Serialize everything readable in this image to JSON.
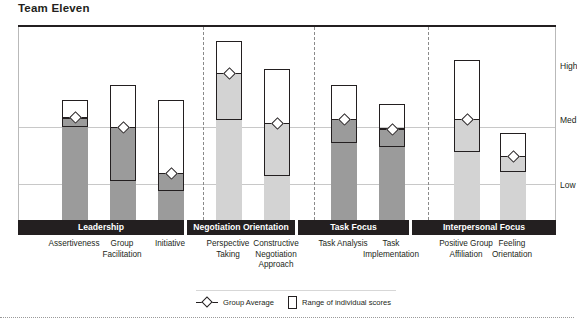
{
  "title": "Team Eleven",
  "axis": {
    "labels": [
      "High",
      "Med",
      "Low"
    ],
    "label_high": "High",
    "label_med": "Med",
    "label_low": "Low"
  },
  "legend": {
    "group_average": "Group Average",
    "range_of_individual_scores": "Range of individual scores"
  },
  "clusters": [
    {
      "name": "Leadership"
    },
    {
      "name": "Negotiation Orientation"
    },
    {
      "name": "Task Focus"
    },
    {
      "name": "Interpersonal Focus"
    }
  ],
  "categories": [
    "Assertiveness",
    "Group Facilitation",
    "Initiative",
    "Perspective Taking",
    "Constructive Negotiation Approach",
    "Task Analysis",
    "Task Implementation",
    "Positive Group Affiliation",
    "Feeling Orientation"
  ],
  "chart_data": {
    "type": "bar",
    "title": "Team Eleven",
    "xlabel": "",
    "ylabel": "",
    "ylim": [
      0,
      100
    ],
    "grid": true,
    "legend_position": "bottom",
    "axis_ticks": [
      {
        "label": "Low",
        "value": 18
      },
      {
        "label": "Med",
        "value": 52
      },
      {
        "label": "High",
        "value": 80
      }
    ],
    "categories": [
      "Assertiveness",
      "Group Facilitation",
      "Initiative",
      "Perspective Taking",
      "Constructive Negotiation Approach",
      "Task Analysis",
      "Task Implementation",
      "Positive Group Affiliation",
      "Feeling Orientation"
    ],
    "cluster_of_category": [
      "Leadership",
      "Leadership",
      "Leadership",
      "Negotiation Orientation",
      "Negotiation Orientation",
      "Task Focus",
      "Task Focus",
      "Interpersonal Focus",
      "Interpersonal Focus"
    ],
    "series": [
      {
        "name": "Group Average",
        "values": [
          53,
          48,
          24,
          76,
          50,
          52,
          47,
          52,
          33
        ]
      },
      {
        "name": "Range of individual scores (min)",
        "values": [
          48,
          20,
          15,
          52,
          23,
          40,
          38,
          35,
          25
        ]
      },
      {
        "name": "Range of individual scores (max)",
        "values": [
          62,
          70,
          62,
          93,
          78,
          70,
          60,
          83,
          45
        ]
      }
    ],
    "points": [
      {
        "category": "Assertiveness",
        "cluster": "Leadership",
        "average": 53,
        "range_min": 48,
        "range_max": 62,
        "shade": "dark"
      },
      {
        "category": "Group Facilitation",
        "cluster": "Leadership",
        "average": 48,
        "range_min": 20,
        "range_max": 70,
        "shade": "dark"
      },
      {
        "category": "Initiative",
        "cluster": "Leadership",
        "average": 24,
        "range_min": 15,
        "range_max": 62,
        "shade": "dark"
      },
      {
        "category": "Perspective Taking",
        "cluster": "Negotiation Orientation",
        "average": 76,
        "range_min": 52,
        "range_max": 93,
        "shade": "light"
      },
      {
        "category": "Constructive Negotiation Approach",
        "cluster": "Negotiation Orientation",
        "average": 50,
        "range_min": 23,
        "range_max": 78,
        "shade": "light"
      },
      {
        "category": "Task Analysis",
        "cluster": "Task Focus",
        "average": 52,
        "range_min": 40,
        "range_max": 70,
        "shade": "dark"
      },
      {
        "category": "Task Implementation",
        "cluster": "Task Focus",
        "average": 47,
        "range_min": 38,
        "range_max": 60,
        "shade": "dark"
      },
      {
        "category": "Positive Group Affiliation",
        "cluster": "Interpersonal Focus",
        "average": 52,
        "range_min": 35,
        "range_max": 83,
        "shade": "light"
      },
      {
        "category": "Feeling Orientation",
        "cluster": "Interpersonal Focus",
        "average": 33,
        "range_min": 25,
        "range_max": 45,
        "shade": "light"
      }
    ]
  },
  "layout": {
    "bar_slots": [
      {
        "cx": 56,
        "w": 26
      },
      {
        "cx": 104,
        "w": 26
      },
      {
        "cx": 152,
        "w": 26
      },
      {
        "cx": 210,
        "w": 26
      },
      {
        "cx": 258,
        "w": 26
      },
      {
        "cx": 325,
        "w": 26
      },
      {
        "cx": 373,
        "w": 26
      },
      {
        "cx": 448,
        "w": 26
      },
      {
        "cx": 494,
        "w": 26
      }
    ],
    "range_box_w": 26,
    "separators_x": [
      184,
      295,
      409
    ],
    "cluster_spans": [
      {
        "name": "Leadership",
        "left": 0,
        "width": 166
      },
      {
        "name": "Negotiation Orientation",
        "left": 169,
        "width": 108
      },
      {
        "name": "Task Focus",
        "left": 280,
        "width": 111
      },
      {
        "name": "Interpersonal Focus",
        "left": 394,
        "width": 144
      }
    ],
    "grid_y": [
      100,
      157
    ],
    "plot_top": 27,
    "plot_h": 193
  },
  "colors": {
    "ink": "#231f20",
    "fill_dark": "#9b9b9b",
    "fill_light": "#d3d3d3",
    "grid": "#c8c8c8",
    "band": "#231f20"
  }
}
